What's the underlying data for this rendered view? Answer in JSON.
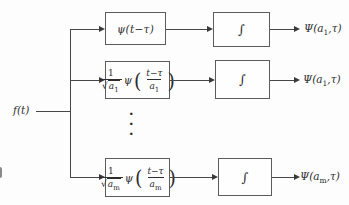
{
  "colors": {
    "line": "#474747",
    "box_border": "#5c5c5c",
    "text": "#2d2d2d",
    "background": "#fdfdfd"
  },
  "figure": {
    "type": "block-diagram",
    "description_topic": "wavelet transform filter bank",
    "input_label": "f(t)",
    "ellipsis_dot": "·",
    "rows": [
      {
        "filter_simple": "ψ(t−τ)",
        "integral": "∫",
        "out_pre": "Ψ(a",
        "out_sub": "1",
        "out_post": ",τ)"
      },
      {
        "coef_num": "1",
        "coef_radical": "√",
        "coef_base": "a",
        "coef_sub": "1",
        "psi": "ψ",
        "paren_open": "(",
        "arg_num": "t−τ",
        "arg_den_base": "a",
        "arg_den_sub": "1",
        "paren_close": ")",
        "integral": "∫",
        "out_pre": "Ψ(a",
        "out_sub": "1",
        "out_post": ",τ)"
      },
      {
        "coef_num": "1",
        "coef_radical": "√",
        "coef_base": "a",
        "coef_sub": "m",
        "psi": "ψ",
        "paren_open": "(",
        "arg_num": "t−τ",
        "arg_den_base": "a",
        "arg_den_sub": "m",
        "paren_close": ")",
        "integral": "∫",
        "out_pre": "Ψ(a",
        "out_sub": "m",
        "out_post": ",τ)"
      }
    ]
  }
}
